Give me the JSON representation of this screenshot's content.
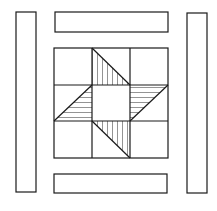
{
  "diagram": {
    "type": "quilt-block",
    "stroke_color": "#1a1a1a",
    "background": "#ffffff",
    "hatch_color": "#555555",
    "borders": {
      "left": {
        "x": 16,
        "y": 12,
        "w": 20,
        "h": 180
      },
      "right": {
        "x": 187,
        "y": 13,
        "w": 20,
        "h": 180
      },
      "top": {
        "x": 55,
        "y": 12,
        "w": 113,
        "h": 20
      },
      "bottom": {
        "x": 54,
        "y": 174,
        "w": 113,
        "h": 19
      }
    },
    "grid": {
      "x": 54,
      "y": 48,
      "size": 114,
      "rows": 3,
      "cols": 3
    }
  }
}
